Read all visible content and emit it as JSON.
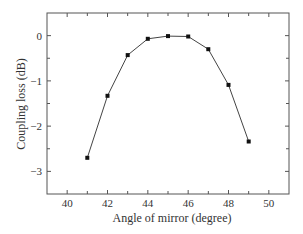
{
  "chart_data": {
    "type": "line",
    "title": "",
    "xlabel": "Angle of mirror (degree)",
    "ylabel": "Coupling loss (dB)",
    "x": [
      41,
      42,
      43,
      44,
      45,
      46,
      47,
      48,
      49
    ],
    "series": [
      {
        "name": "Coupling loss",
        "values": [
          -2.7,
          -1.33,
          -0.43,
          -0.07,
          -0.01,
          -0.02,
          -0.3,
          -1.09,
          -2.34
        ],
        "marker": "square",
        "color": "#111111"
      }
    ],
    "xlim": [
      39,
      51
    ],
    "ylim": [
      -3.5,
      0.5
    ],
    "xticks": [
      40,
      42,
      44,
      46,
      48,
      50
    ],
    "xtick_labels": [
      "40",
      "42",
      "44",
      "46",
      "48",
      "50"
    ],
    "yticks": [
      0,
      -1,
      -2,
      -3
    ],
    "ytick_labels": [
      "0",
      "−1",
      "−2",
      "−3"
    ],
    "grid": false,
    "legend": null
  },
  "colors": {
    "frame": "#555555",
    "line": "#444444",
    "marker": "#111111",
    "text": "#333333"
  }
}
